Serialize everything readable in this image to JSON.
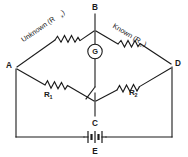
{
  "diagram": {
    "type": "circuit-schematic",
    "colors": {
      "ink": "#1a1a1a",
      "background": "#ffffff"
    },
    "nodes": [
      {
        "id": "A",
        "label": "A",
        "x": 16,
        "y": 68,
        "role": "left-bridge-node"
      },
      {
        "id": "B",
        "label": "B",
        "x": 95,
        "y": 13,
        "role": "top-bridge-node"
      },
      {
        "id": "C",
        "label": "C",
        "x": 95,
        "y": 117,
        "role": "bottom-bridge-node"
      },
      {
        "id": "D",
        "label": "D",
        "x": 172,
        "y": 66,
        "role": "right-bridge-node"
      }
    ],
    "components": [
      {
        "id": "rx",
        "kind": "resistor",
        "label": "Unknown (R",
        "subscript": "x",
        "label_close": ")",
        "between": [
          "A",
          "B"
        ],
        "arm": "upper-left"
      },
      {
        "id": "rs",
        "kind": "resistor",
        "label": "Known (R",
        "subscript": "s",
        "label_close": ")",
        "between": [
          "B",
          "D"
        ],
        "arm": "upper-right"
      },
      {
        "id": "r1",
        "kind": "resistor",
        "label": "R",
        "subscript": "1",
        "label_close": "",
        "between": [
          "A",
          "C"
        ],
        "arm": "lower-left"
      },
      {
        "id": "r2",
        "kind": "resistor",
        "label": "R",
        "subscript": "2",
        "label_close": "",
        "between": [
          "C",
          "D"
        ],
        "arm": "lower-right"
      },
      {
        "id": "g",
        "kind": "galvanometer",
        "label": "G",
        "between": [
          "B",
          "C"
        ],
        "arm": "bridge-detector"
      },
      {
        "id": "sw",
        "kind": "switch",
        "label": "",
        "state": "open",
        "between": [
          "G",
          "C"
        ],
        "arm": "bridge-detector"
      },
      {
        "id": "e",
        "kind": "battery",
        "label": "E",
        "between": [
          "A",
          "D"
        ],
        "arm": "supply-rail"
      }
    ]
  }
}
